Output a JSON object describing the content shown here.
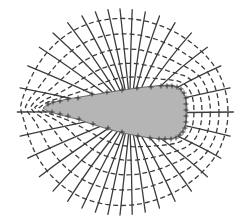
{
  "diagram": {
    "type": "electric-field-around-charged-conductor",
    "colors": {
      "background": "#ffffff",
      "conductor_fill": "#b5b5b5",
      "line": "#3c3c3c",
      "charge": "#3a3a3a"
    },
    "conductor": {
      "shape": "teardrop",
      "tip": [
        43,
        108
      ],
      "blunt_end_x": 187,
      "charge_symbol": "+"
    },
    "charges": [
      [
        48,
        104
      ],
      [
        53,
        102
      ],
      [
        60,
        101
      ],
      [
        68,
        99
      ],
      [
        78,
        98
      ],
      [
        92,
        94
      ],
      [
        107,
        92
      ],
      [
        122,
        90
      ],
      [
        137,
        88
      ],
      [
        151,
        87
      ],
      [
        161,
        86
      ],
      [
        167,
        86
      ],
      [
        172,
        86
      ],
      [
        177,
        87
      ],
      [
        181,
        89
      ],
      [
        184,
        93
      ],
      [
        186,
        98
      ],
      [
        186,
        104
      ],
      [
        186,
        110
      ],
      [
        186,
        116
      ],
      [
        186,
        122
      ],
      [
        185,
        128
      ],
      [
        183,
        132
      ],
      [
        180,
        135
      ],
      [
        176,
        138
      ],
      [
        171,
        139
      ],
      [
        165,
        139
      ],
      [
        159,
        139
      ],
      [
        150,
        138
      ],
      [
        138,
        136
      ],
      [
        122,
        132
      ],
      [
        108,
        128
      ],
      [
        93,
        124
      ],
      [
        79,
        119
      ],
      [
        68,
        116
      ],
      [
        60,
        114
      ],
      [
        52,
        112
      ]
    ],
    "field_line_count": 36,
    "equipotential_count": 5,
    "legend": {
      "solid_lines": "electric field lines",
      "dashed_lines": "equipotential surfaces",
      "plus_signs": "surface charges"
    }
  }
}
